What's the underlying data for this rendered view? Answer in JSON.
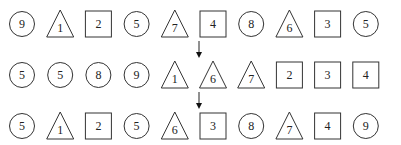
{
  "diagram": {
    "rows": [
      {
        "items": [
          {
            "shape": "circle",
            "value": "9"
          },
          {
            "shape": "triangle",
            "value": "1"
          },
          {
            "shape": "square",
            "value": "2"
          },
          {
            "shape": "circle",
            "value": "5"
          },
          {
            "shape": "triangle",
            "value": "7"
          },
          {
            "shape": "square",
            "value": "4"
          },
          {
            "shape": "circle",
            "value": "8"
          },
          {
            "shape": "triangle",
            "value": "6"
          },
          {
            "shape": "square",
            "value": "3"
          },
          {
            "shape": "circle",
            "value": "5"
          }
        ]
      },
      {
        "items": [
          {
            "shape": "circle",
            "value": "5"
          },
          {
            "shape": "circle",
            "value": "5"
          },
          {
            "shape": "circle",
            "value": "8"
          },
          {
            "shape": "circle",
            "value": "9"
          },
          {
            "shape": "triangle",
            "value": "1"
          },
          {
            "shape": "triangle",
            "value": "6"
          },
          {
            "shape": "triangle",
            "value": "7"
          },
          {
            "shape": "square",
            "value": "2"
          },
          {
            "shape": "square",
            "value": "3"
          },
          {
            "shape": "square",
            "value": "4"
          }
        ]
      },
      {
        "items": [
          {
            "shape": "circle",
            "value": "5"
          },
          {
            "shape": "triangle",
            "value": "1"
          },
          {
            "shape": "square",
            "value": "2"
          },
          {
            "shape": "circle",
            "value": "5"
          },
          {
            "shape": "triangle",
            "value": "6"
          },
          {
            "shape": "square",
            "value": "3"
          },
          {
            "shape": "circle",
            "value": "8"
          },
          {
            "shape": "triangle",
            "value": "7"
          },
          {
            "shape": "square",
            "value": "4"
          },
          {
            "shape": "circle",
            "value": "9"
          }
        ]
      }
    ],
    "arrows": [
      {
        "from_row": 0,
        "to_row": 1
      },
      {
        "from_row": 1,
        "to_row": 2
      }
    ],
    "stroke_color": "#333333"
  }
}
